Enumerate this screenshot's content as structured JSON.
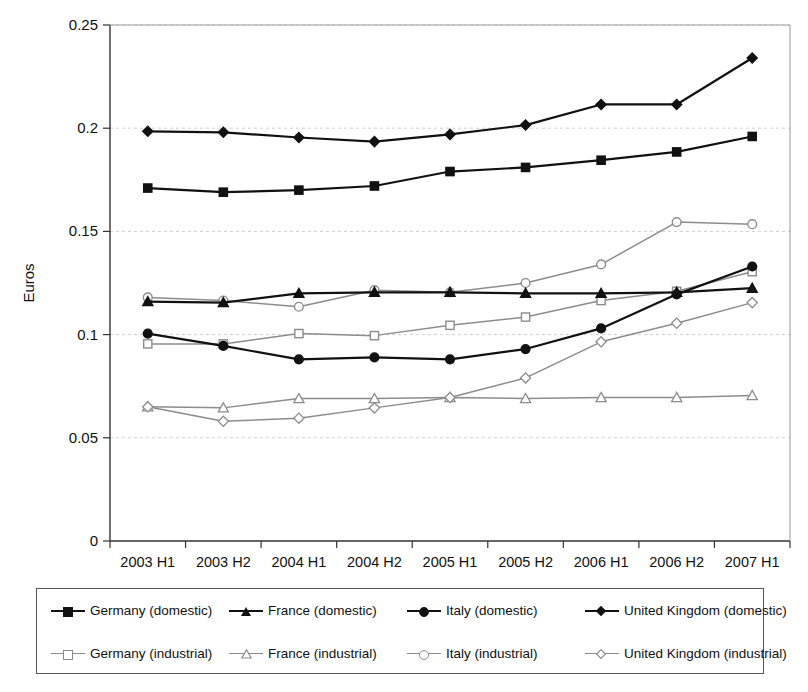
{
  "chart_data": {
    "type": "line",
    "title": "",
    "xlabel": "",
    "ylabel": "Euros",
    "categories": [
      "2003 H1",
      "2003 H2",
      "2004 H1",
      "2004 H2",
      "2005 H1",
      "2005 H2",
      "2006 H1",
      "2006 H2",
      "2007 H1"
    ],
    "ylim": [
      0,
      0.25
    ],
    "yticks": [
      0,
      0.05,
      0.1,
      0.15,
      0.2,
      0.25
    ],
    "ytick_labels": [
      "0",
      "0.05",
      "0.1",
      "0.15",
      "0.2",
      "0.25"
    ],
    "grid": "horizontal-dashed",
    "legend_position": "bottom",
    "legend_columns": 4,
    "series": [
      {
        "name": "Germany (domestic)",
        "marker": "filled-square",
        "color": "#111111",
        "values": [
          0.171,
          0.169,
          0.17,
          0.172,
          0.179,
          0.181,
          0.1845,
          0.1885,
          0.196
        ]
      },
      {
        "name": "France (domestic)",
        "marker": "filled-triangle",
        "color": "#111111",
        "values": [
          0.116,
          0.1155,
          0.12,
          0.1205,
          0.1205,
          0.12,
          0.12,
          0.1205,
          0.1225
        ]
      },
      {
        "name": "Italy (domestic)",
        "marker": "filled-circle",
        "color": "#111111",
        "values": [
          0.1005,
          0.0945,
          0.088,
          0.089,
          0.088,
          0.093,
          0.103,
          0.1195,
          0.133
        ]
      },
      {
        "name": "United Kingdom (domestic)",
        "marker": "filled-diamond",
        "color": "#111111",
        "values": [
          0.1985,
          0.198,
          0.1955,
          0.1935,
          0.197,
          0.2015,
          0.2115,
          0.2115,
          0.234
        ]
      },
      {
        "name": "Germany (industrial)",
        "marker": "open-square",
        "color": "#8c8c8c",
        "values": [
          0.0955,
          0.0955,
          0.1005,
          0.0995,
          0.1045,
          0.1085,
          0.1165,
          0.121,
          0.1305
        ]
      },
      {
        "name": "France (industrial)",
        "marker": "open-triangle",
        "color": "#8c8c8c",
        "values": [
          0.065,
          0.0645,
          0.069,
          0.069,
          0.0695,
          0.069,
          0.0695,
          0.0695,
          0.0705
        ]
      },
      {
        "name": "Italy (industrial)",
        "marker": "open-circle",
        "color": "#8c8c8c",
        "values": [
          0.118,
          0.1165,
          0.1135,
          0.1215,
          0.1205,
          0.125,
          0.134,
          0.1545,
          0.1535
        ]
      },
      {
        "name": "United Kingdom (industrial)",
        "marker": "open-diamond",
        "color": "#8c8c8c",
        "values": [
          0.065,
          0.058,
          0.0595,
          0.0645,
          0.0695,
          0.079,
          0.0965,
          0.1055,
          0.1155
        ]
      }
    ]
  },
  "legend": {
    "row1": [
      {
        "label": "Germany (domestic)",
        "marker": "filled-square",
        "color": "#111111"
      },
      {
        "label": "France (domestic)",
        "marker": "filled-triangle",
        "color": "#111111"
      },
      {
        "label": "Italy (domestic)",
        "marker": "filled-circle",
        "color": "#111111"
      },
      {
        "label": "United Kingdom (domestic)",
        "marker": "filled-diamond",
        "color": "#111111"
      }
    ],
    "row2": [
      {
        "label": "Germany (industrial)",
        "marker": "open-square",
        "color": "#8c8c8c"
      },
      {
        "label": "France (industrial)",
        "marker": "open-triangle",
        "color": "#8c8c8c"
      },
      {
        "label": "Italy (industrial)",
        "marker": "open-circle",
        "color": "#8c8c8c"
      },
      {
        "label": "United Kingdom (industrial)",
        "marker": "open-diamond",
        "color": "#8c8c8c"
      }
    ]
  },
  "axis": {
    "y_title": "Euros"
  },
  "colors": {
    "domestic": "#111111",
    "industrial": "#8c8c8c",
    "grid": "#cfcfcf",
    "axis": "#333333"
  }
}
